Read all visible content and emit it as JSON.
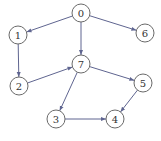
{
  "diagram": {
    "type": "directed-graph",
    "node_radius": 9,
    "colors": {
      "edge": "#5f6590",
      "node_stroke": "#6a6a6a",
      "node_fill": "#ffffff",
      "label": "#333333"
    },
    "nodes": [
      {
        "id": "0",
        "label": "0",
        "x": 81,
        "y": 13
      },
      {
        "id": "1",
        "label": "1",
        "x": 18,
        "y": 35
      },
      {
        "id": "6",
        "label": "6",
        "x": 145,
        "y": 33
      },
      {
        "id": "7",
        "label": "7",
        "x": 81,
        "y": 64
      },
      {
        "id": "2",
        "label": "2",
        "x": 19,
        "y": 86
      },
      {
        "id": "5",
        "label": "5",
        "x": 143,
        "y": 83
      },
      {
        "id": "3",
        "label": "3",
        "x": 56,
        "y": 119
      },
      {
        "id": "4",
        "label": "4",
        "x": 115,
        "y": 119
      }
    ],
    "edges": [
      {
        "from": "0",
        "to": "1"
      },
      {
        "from": "0",
        "to": "7"
      },
      {
        "from": "0",
        "to": "6"
      },
      {
        "from": "1",
        "to": "2"
      },
      {
        "from": "2",
        "to": "7"
      },
      {
        "from": "7",
        "to": "5"
      },
      {
        "from": "7",
        "to": "3"
      },
      {
        "from": "3",
        "to": "4"
      },
      {
        "from": "5",
        "to": "4"
      }
    ]
  }
}
